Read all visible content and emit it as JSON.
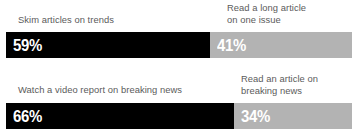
{
  "theme": {
    "background": "#ffffff",
    "primary_color": "#000000",
    "secondary_color": "#b3b3b3",
    "label_color": "#5b5b5b",
    "value_color": "#ffffff"
  },
  "chart_data": {
    "type": "bar",
    "orientation": "horizontal",
    "stacked": true,
    "title": "",
    "subtitle": "",
    "xlabel": "",
    "ylabel": "",
    "xlim": [
      0,
      100
    ],
    "grid": false,
    "legend_position": "inline-labels",
    "categories": [
      "Row 1",
      "Row 2"
    ],
    "series": [
      {
        "name": "Primary",
        "color": "#000000",
        "values": [
          59,
          66
        ],
        "value_labels": [
          "59%",
          "41%"
        ]
      },
      {
        "name": "Secondary",
        "color": "#b3b3b3",
        "values": [
          41,
          34
        ],
        "value_labels": [
          "34%",
          "34%"
        ]
      }
    ],
    "rows": [
      {
        "primary": {
          "label": "Skim articles on trends",
          "value": 59,
          "value_label": "59%",
          "color": "#000000"
        },
        "secondary": {
          "label": "Read a long article\non one issue",
          "value": 41,
          "value_label": "41%",
          "color": "#b3b3b3"
        }
      },
      {
        "primary": {
          "label": "Watch a video report on breaking news",
          "value": 66,
          "value_label": "66%",
          "color": "#000000"
        },
        "secondary": {
          "label": "Read an article on\nbreaking news",
          "value": 34,
          "value_label": "34%",
          "color": "#b3b3b3"
        }
      }
    ]
  }
}
